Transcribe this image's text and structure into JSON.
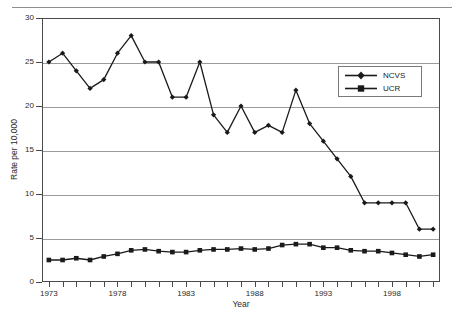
{
  "chart_data": {
    "type": "line",
    "title": "",
    "xlabel": "Year",
    "ylabel": "Rate per 10,000",
    "xlim": [
      1972.5,
      2001.5
    ],
    "ylim": [
      0,
      30
    ],
    "grid": true,
    "legend_position": "upper-right",
    "y_ticks": [
      0,
      5,
      10,
      15,
      20,
      25,
      30
    ],
    "y_tick_labels": [
      "0",
      "5",
      "10",
      "15",
      "20",
      "25",
      "30"
    ],
    "x_ticks": [
      1973,
      1978,
      1983,
      1988,
      1993,
      1998
    ],
    "x_tick_labels": [
      "1973",
      "1978",
      "1983",
      "1988",
      "1993",
      "1998"
    ],
    "x": [
      1973,
      1974,
      1975,
      1976,
      1977,
      1978,
      1979,
      1980,
      1981,
      1982,
      1983,
      1984,
      1985,
      1986,
      1987,
      1988,
      1989,
      1990,
      1991,
      1992,
      1993,
      1994,
      1995,
      1996,
      1997,
      1998,
      1999,
      2000,
      2001
    ],
    "series": [
      {
        "name": "NCVS",
        "marker": "diamond",
        "color": "#1a1a1a",
        "values": [
          25,
          26,
          24,
          22,
          23,
          26,
          28,
          25,
          25,
          21,
          21,
          25,
          19,
          17,
          20,
          17,
          17.8,
          17,
          21.8,
          18,
          16,
          14,
          12,
          9,
          9,
          9,
          9,
          6,
          6
        ]
      },
      {
        "name": "UCR",
        "marker": "square",
        "color": "#1a1a1a",
        "values": [
          2.5,
          2.5,
          2.7,
          2.5,
          2.9,
          3.2,
          3.6,
          3.7,
          3.5,
          3.4,
          3.4,
          3.6,
          3.7,
          3.7,
          3.8,
          3.7,
          3.8,
          4.2,
          4.3,
          4.3,
          3.9,
          3.9,
          3.6,
          3.5,
          3.5,
          3.3,
          3.1,
          2.9,
          3.1
        ]
      }
    ]
  },
  "legend": {
    "entries": [
      {
        "label": "NCVS"
      },
      {
        "label": "UCR"
      }
    ]
  },
  "axes": {
    "x_title": "Year",
    "y_title": "Rate per 10,000"
  }
}
